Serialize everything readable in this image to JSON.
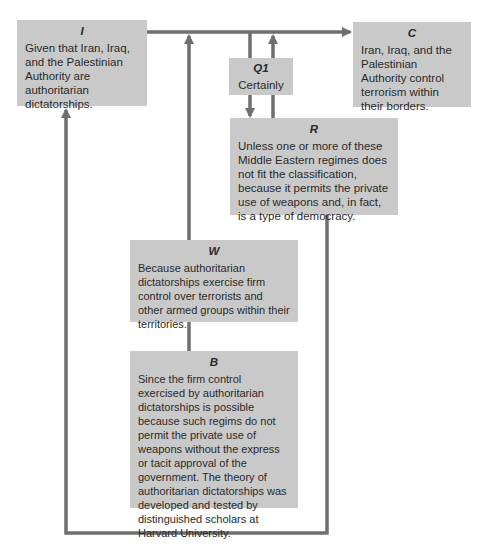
{
  "diagram": {
    "type": "Toulmin argument model",
    "colors": {
      "box_fill": "#c9c9c9",
      "line": "#6f6f6f",
      "text": "#2a2a2a"
    },
    "boxes": {
      "I": {
        "label": "I",
        "text": "Given that Iran, Iraq, and the Palestinian Authority are authoritarian dictatorships."
      },
      "C": {
        "label": "C",
        "text": "Iran, Iraq, and the Palestinian Authority control terrorism within their borders."
      },
      "Q1": {
        "label": "Q1",
        "text": "Certainly"
      },
      "R": {
        "label": "R",
        "text": "Unless one or more of these Middle Eastern regimes does not fit the classification, because it permits the private use of weapons and, in fact, is a type of democracy."
      },
      "W": {
        "label": "W",
        "text": "Because authoritarian dictatorships exercise firm control over terrorists and other armed groups within their territories."
      },
      "B": {
        "label": "B",
        "text": "Since the firm control  exercised by authoritarian dictatorships is possible because such regims do not permit the private use of weapons without the express or tacit approval of the government. The theory of authoritarian dictatorships was developed and tested by distinguished scholars at Harvard University."
      }
    },
    "connections": [
      {
        "from": "I",
        "to": "C",
        "kind": "arrow"
      },
      {
        "from": "main-line",
        "to": "Q1",
        "kind": "line"
      },
      {
        "from": "Q1",
        "to": "R",
        "kind": "arrow"
      },
      {
        "from": "R",
        "to": "main-line",
        "kind": "arrow"
      },
      {
        "from": "W",
        "to": "main-line",
        "kind": "arrow"
      },
      {
        "from": "B",
        "to": "W",
        "kind": "line"
      },
      {
        "from": "R",
        "to": "I",
        "kind": "arrow-loop"
      }
    ]
  }
}
